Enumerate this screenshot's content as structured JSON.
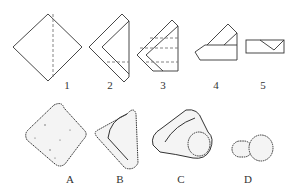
{
  "diagram": {
    "title": "",
    "folding_steps": [
      {
        "label": "1",
        "description": "square sheet rotated as diamond with dashed vertical fold line"
      },
      {
        "label": "2",
        "description": "folded into chevron shape with dashed horizontal fold line"
      },
      {
        "label": "3",
        "description": "further folded with multiple dashed fold lines"
      },
      {
        "label": "4",
        "description": "arrow-like shape with diagonal flap on top"
      },
      {
        "label": "5",
        "description": "rectangular envelope-like packet with V flap"
      }
    ],
    "results": [
      {
        "label": "A",
        "description": "square-shaped object"
      },
      {
        "label": "B",
        "description": "triangular/wedge-shaped object"
      },
      {
        "label": "C",
        "description": "irregular rock-like object with rounded lump"
      },
      {
        "label": "D",
        "description": "mushroom/peg-shaped object"
      }
    ],
    "colors": {
      "line": "#333333",
      "dash": "#666666",
      "background": "#ffffff"
    }
  }
}
